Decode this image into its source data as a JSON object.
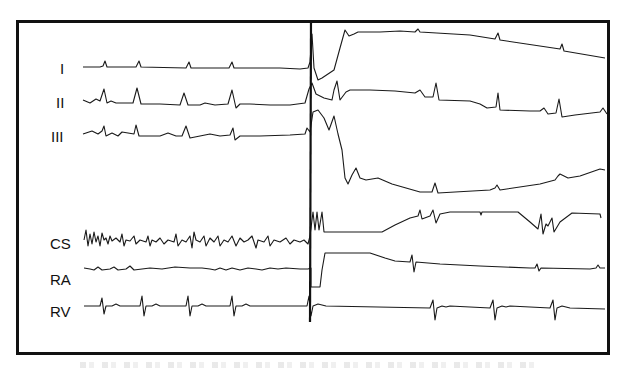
{
  "figure": {
    "type": "intracardiac electrogram recording",
    "stimulus_marker_x": 311,
    "channels": [
      {
        "id": "I",
        "label": "I",
        "y": 68
      },
      {
        "id": "II",
        "label": "II",
        "y": 102
      },
      {
        "id": "III",
        "label": "III",
        "y": 136
      },
      {
        "id": "CS",
        "label": "CS",
        "y": 242
      },
      {
        "id": "RA",
        "label": "RA",
        "y": 278
      },
      {
        "id": "RV",
        "label": "RV",
        "y": 310
      }
    ]
  },
  "colors": {
    "trace": "#1a1a1a",
    "frame": "#111111",
    "background": "#ffffff"
  }
}
